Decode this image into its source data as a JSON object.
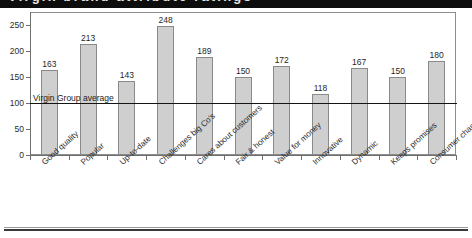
{
  "banner": {
    "clipped_title_text": "Virgin brand attribute ratings"
  },
  "chart_data": {
    "type": "bar",
    "title": "",
    "xlabel": "",
    "ylabel": "",
    "ylim": [
      0,
      275
    ],
    "yticks": [
      0,
      50,
      100,
      150,
      200,
      250
    ],
    "grid": false,
    "legend": false,
    "categories": [
      "Good quality",
      "Popular",
      "Up-to-date",
      "Challenges big Co's",
      "Cares about customers",
      "Fair & honest",
      "Value for money",
      "Innovative",
      "Dynamic",
      "Keeps promises",
      "Consumer champion"
    ],
    "values": [
      163,
      213,
      143,
      248,
      189,
      150,
      172,
      118,
      167,
      150,
      180
    ],
    "value_labels": [
      "163",
      "213",
      "143",
      "248",
      "189",
      "150",
      "172",
      "118",
      "167",
      "150",
      "180"
    ],
    "annotations": [
      {
        "name": "average-line",
        "label": "Virgin Group average",
        "value": 100
      }
    ],
    "colors": {
      "bar_fill": "#cfcfcf",
      "bar_stroke": "#8a8a8a",
      "axis": "#6f6f6f",
      "average_line": "#141414",
      "text": "#1f1f1f",
      "banner": "#0d0d0d"
    }
  }
}
